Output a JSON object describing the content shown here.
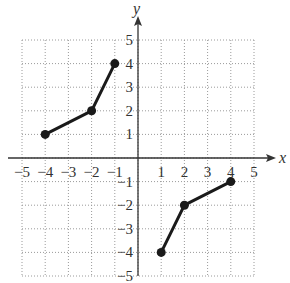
{
  "chart_data": {
    "type": "line",
    "title": "",
    "xlabel": "x",
    "ylabel": "y",
    "xlim": [
      -5,
      5
    ],
    "ylim": [
      -5,
      5
    ],
    "grid": true,
    "x_ticks": [
      -5,
      -4,
      -3,
      -2,
      -1,
      1,
      2,
      3,
      4,
      5
    ],
    "y_ticks": [
      -5,
      -4,
      -3,
      -2,
      -1,
      1,
      2,
      3,
      4,
      5
    ],
    "series": [
      {
        "name": "segment-left",
        "points": [
          [
            -4,
            1
          ],
          [
            -2,
            2
          ],
          [
            -1,
            4
          ]
        ]
      },
      {
        "name": "segment-right",
        "points": [
          [
            1,
            -4
          ],
          [
            2,
            -2
          ],
          [
            4,
            -1
          ]
        ]
      }
    ],
    "colors": {
      "line": "#1a1a1a",
      "grid": "#9a9a9a",
      "axis": "#333333"
    }
  }
}
